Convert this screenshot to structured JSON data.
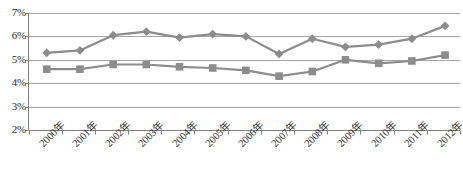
{
  "chart_data": {
    "type": "line",
    "title": "",
    "xlabel": "",
    "ylabel": "",
    "ylim": [
      2,
      7
    ],
    "ytick_labels": [
      "7%",
      "6%",
      "5%",
      "4%",
      "3%",
      "2%"
    ],
    "ytick_values": [
      7,
      6,
      5,
      4,
      3,
      2
    ],
    "grid": true,
    "legend": "none",
    "categories": [
      "2000年",
      "2001年",
      "2002年",
      "2003年",
      "2004年",
      "2005年",
      "2006年",
      "2007年",
      "2008年",
      "2009年",
      "2010年",
      "2011年",
      "2012年"
    ],
    "series": [
      {
        "name": "series-1",
        "marker": "diamond",
        "color": "#8c8c8c",
        "values": [
          5.3,
          5.4,
          6.05,
          6.2,
          5.95,
          6.1,
          6.0,
          5.25,
          5.9,
          5.55,
          5.65,
          5.9,
          6.45
        ]
      },
      {
        "name": "series-2",
        "marker": "square",
        "color": "#8c8c8c",
        "values": [
          4.6,
          4.6,
          4.8,
          4.8,
          4.7,
          4.65,
          4.55,
          4.3,
          4.5,
          5.0,
          4.85,
          4.95,
          5.2
        ]
      }
    ],
    "colors": {
      "line": "#8c8c8c",
      "grid": "#a6a6a6",
      "axis": "#808080",
      "text": "#2b2b2b",
      "background": "#ffffff"
    }
  }
}
